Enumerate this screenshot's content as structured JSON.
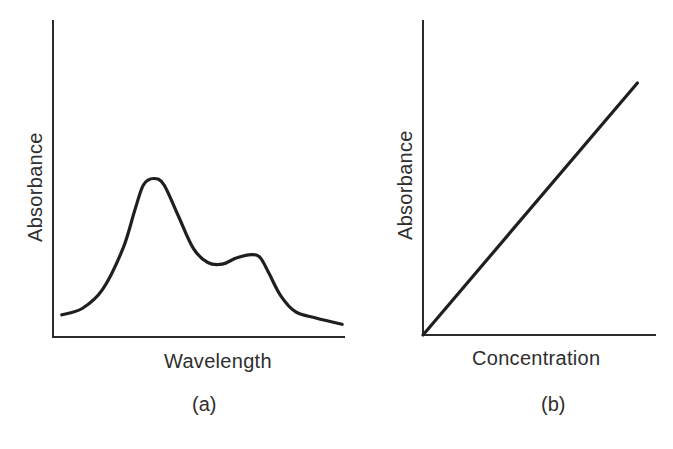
{
  "figure": {
    "panels": [
      {
        "id": "a",
        "panel_label": "(a)",
        "xlabel": "Wavelength",
        "ylabel": "Absorbance"
      },
      {
        "id": "b",
        "panel_label": "(b)",
        "xlabel": "Concentration",
        "ylabel": "Absorbance"
      }
    ]
  },
  "style": {
    "line_color": "#1f1f1f",
    "axis_color": "#2b2b2b",
    "background": "#ffffff"
  },
  "chart_data": [
    {
      "type": "line",
      "title": "(a)",
      "xlabel": "Wavelength",
      "ylabel": "Absorbance",
      "xlim": [
        0,
        1
      ],
      "ylim": [
        0,
        1
      ],
      "grid": false,
      "legend": "none",
      "ticks": "none",
      "note": "Qualitative absorption spectrum; normalized values estimated from pixel positions",
      "series": [
        {
          "name": "Absorption spectrum",
          "x": [
            0.03,
            0.1,
            0.17,
            0.24,
            0.28,
            0.31,
            0.345,
            0.38,
            0.43,
            0.48,
            0.53,
            0.58,
            0.63,
            0.68,
            0.71,
            0.74,
            0.78,
            0.83,
            0.9,
            0.99
          ],
          "y": [
            0.07,
            0.09,
            0.15,
            0.28,
            0.4,
            0.48,
            0.5,
            0.48,
            0.38,
            0.28,
            0.235,
            0.23,
            0.25,
            0.26,
            0.25,
            0.2,
            0.13,
            0.08,
            0.06,
            0.04
          ]
        }
      ],
      "annotations": [
        {
          "label": "main peak",
          "x": 0.345,
          "y": 0.5
        },
        {
          "label": "valley",
          "x": 0.58,
          "y": 0.23
        },
        {
          "label": "secondary peak",
          "x": 0.68,
          "y": 0.26
        }
      ]
    },
    {
      "type": "line",
      "title": "(b)",
      "xlabel": "Concentration",
      "ylabel": "Absorbance",
      "xlim": [
        0,
        1
      ],
      "ylim": [
        0,
        1
      ],
      "grid": false,
      "legend": "none",
      "ticks": "none",
      "note": "Linear relationship through origin (Beer-Lambert law); normalized values",
      "series": [
        {
          "name": "Calibration line",
          "x": [
            0,
            0.92
          ],
          "y": [
            0,
            0.8
          ]
        }
      ]
    }
  ]
}
